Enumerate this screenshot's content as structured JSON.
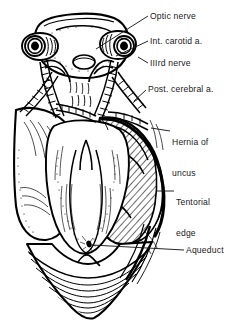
{
  "figure": {
    "background_color": "#ffffff",
    "ink_color": "#000000",
    "label_color": "#1a1a1a",
    "width": 234,
    "height": 331
  },
  "labels": {
    "optic_nerve": "Optic nerve",
    "internal_carotid": "Int. carotid a.",
    "third_nerve": "IIIrd nerve",
    "posterior_cerebral": "Post. cerebral a.",
    "hernia_of_uncus_line1": "Hernia of",
    "hernia_of_uncus_line2": "uncus",
    "tentorial_edge_line1": "Tentorial",
    "tentorial_edge_line2": "edge",
    "aqueduct": "Aqueduct"
  },
  "structures": [
    {
      "name": "optic-chiasm",
      "side": "midline",
      "shading": "stipple"
    },
    {
      "name": "optic-nerve-stump-left",
      "side": "left",
      "shading": "concentric-rings"
    },
    {
      "name": "optic-nerve-stump-right",
      "side": "right",
      "shading": "concentric-rings"
    },
    {
      "name": "internal-carotid-artery-left",
      "side": "left",
      "shading": "outline"
    },
    {
      "name": "internal-carotid-artery-right",
      "side": "right",
      "shading": "outline"
    },
    {
      "name": "third-nerve-left",
      "side": "left",
      "shading": "ladder-rungs"
    },
    {
      "name": "third-nerve-right",
      "side": "right",
      "shading": "ladder-rungs"
    },
    {
      "name": "posterior-cerebral-artery-left",
      "side": "left",
      "shading": "ladder-rungs"
    },
    {
      "name": "posterior-cerebral-artery-right",
      "side": "right",
      "shading": "ladder-rungs"
    },
    {
      "name": "temporal-lobe-left-normal",
      "side": "left",
      "shading": "plain"
    },
    {
      "name": "temporal-lobe-right-herniated",
      "side": "right",
      "shading": "diagonal-hatch"
    },
    {
      "name": "tentorial-edge",
      "side": "right",
      "shading": "heavy-outline"
    },
    {
      "name": "midbrain",
      "side": "midline",
      "shading": "stipple-and-lines"
    },
    {
      "name": "cerebral-aqueduct",
      "side": "midline",
      "shading": "solid-black-dot"
    },
    {
      "name": "cerebellum-vermis",
      "side": "midline",
      "shading": "wavy-lines"
    }
  ]
}
